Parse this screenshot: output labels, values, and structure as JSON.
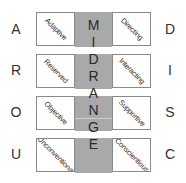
{
  "left_letters": [
    "A",
    "R",
    "O",
    "U"
  ],
  "right_letters": [
    "D",
    "I",
    "S",
    "C"
  ],
  "left_boxes": [
    "Adaptive",
    "Reserved",
    "Objective",
    "Unconventional"
  ],
  "right_boxes": [
    "Directing",
    "Interacting",
    "Supportive",
    "Conscientious"
  ],
  "middle_word": [
    "M",
    "I",
    "D",
    "R",
    "A",
    "N",
    "G",
    "E"
  ],
  "colors": {
    "middle_fill": "#a9a9a9",
    "box_border": "#8a8a8a"
  }
}
